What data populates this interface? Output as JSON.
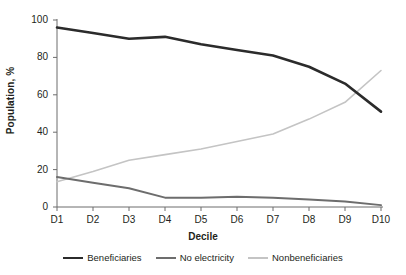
{
  "chart_data": {
    "type": "line",
    "title": "",
    "xlabel": "Decile",
    "ylabel": "Population, %",
    "categories": [
      "D1",
      "D2",
      "D3",
      "D4",
      "D5",
      "D6",
      "D7",
      "D8",
      "D9",
      "D10"
    ],
    "ylim": [
      0,
      100
    ],
    "yticks": [
      0,
      20,
      40,
      60,
      80,
      100
    ],
    "grid": false,
    "legend_position": "bottom",
    "series": [
      {
        "name": "Beneficiaries",
        "color": "#2b2b2b",
        "width": 2.6,
        "values": [
          96,
          93,
          90,
          91,
          87,
          84,
          81,
          75,
          66,
          51
        ]
      },
      {
        "name": "No electricity",
        "color": "#6d6d6d",
        "width": 2.0,
        "values": [
          16,
          13,
          10,
          5,
          5,
          5.5,
          5,
          4,
          3,
          1
        ]
      },
      {
        "name": "Nonbeneficiaries",
        "color": "#c4c4c4",
        "width": 1.6,
        "values": [
          13.5,
          19,
          25,
          28,
          31,
          35,
          39,
          47,
          56,
          73
        ]
      }
    ]
  },
  "axis": {
    "y_tick_labels": [
      "0",
      "20",
      "40",
      "60",
      "80",
      "100"
    ],
    "x_tick_labels": [
      "D1",
      "D2",
      "D3",
      "D4",
      "D5",
      "D6",
      "D7",
      "D8",
      "D9",
      "D10"
    ]
  },
  "colors": {
    "axis": "#6d6d6d",
    "text": "#231f20",
    "background": "#ffffff"
  }
}
